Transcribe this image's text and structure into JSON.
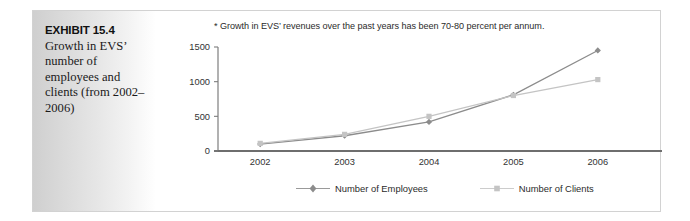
{
  "exhibit": {
    "number_label": "EXHIBIT 15.4",
    "caption": "Growth in EVS’ number of employees and clients (from 2002–2006)"
  },
  "chart_data": {
    "type": "line",
    "title": "",
    "note": "* Growth in EVS’ revenues over the past years has been 70-80 percent per annum.",
    "categories": [
      "2002",
      "2003",
      "2004",
      "2005",
      "2006"
    ],
    "series": [
      {
        "name": "Number of Employees",
        "values": [
          100,
          220,
          420,
          810,
          1450
        ],
        "color": "#8c8c8c",
        "marker": "diamond"
      },
      {
        "name": "Number of Clients",
        "values": [
          110,
          240,
          500,
          800,
          1030
        ],
        "color": "#c4c4c4",
        "marker": "square"
      }
    ],
    "xlabel": "",
    "ylabel": "",
    "ylim": [
      0,
      1500
    ],
    "yticks": [
      0,
      500,
      1000,
      1500
    ],
    "ytick_labels": [
      "0",
      "500",
      "1000",
      "1500"
    ],
    "grid": false,
    "legend_position": "bottom",
    "axis_color": "#7d7d7d"
  },
  "legend": {
    "items": [
      {
        "label": "Number of Employees"
      },
      {
        "label": "Number of Clients"
      }
    ]
  }
}
